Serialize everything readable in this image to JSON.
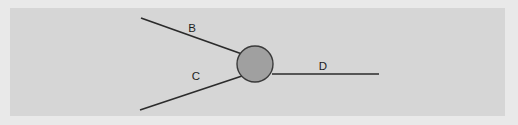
{
  "figure": {
    "kind": "particle-interaction-diagram",
    "width": 518,
    "height": 125,
    "colors": {
      "outer_background": "#e9e9e9",
      "panel_background": "#d6d6d6",
      "line": "#2b2b2b",
      "blob_fill": "#a0a0a0",
      "blob_stroke": "#3a3a3a",
      "label_text": "#1e1e1e"
    },
    "panel": {
      "x": 10,
      "y": 8,
      "width": 495,
      "height": 108
    },
    "vertex": {
      "name": "interaction-blob",
      "cx": 255,
      "cy": 64,
      "r": 18
    },
    "legs": [
      {
        "id": "leg-b",
        "label": "B",
        "direction": "incoming",
        "x1": 141,
        "y1": 18,
        "x2": 242,
        "y2": 54,
        "label_x": 192,
        "label_y": 29
      },
      {
        "id": "leg-c",
        "label": "C",
        "direction": "incoming",
        "x1": 140,
        "y1": 110,
        "x2": 242,
        "y2": 76,
        "label_x": 196,
        "label_y": 77
      },
      {
        "id": "leg-d",
        "label": "D",
        "direction": "outgoing",
        "x1": 272,
        "y1": 74,
        "x2": 379,
        "y2": 74,
        "label_x": 323,
        "label_y": 67
      }
    ]
  }
}
